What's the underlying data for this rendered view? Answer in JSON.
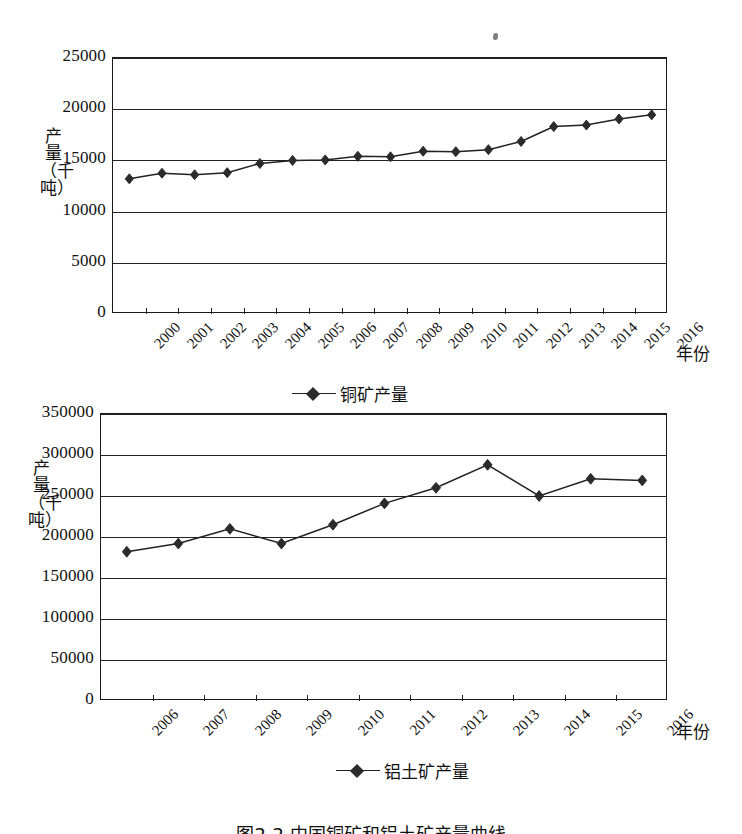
{
  "figure": {
    "caption": "图2-2    中国铜矿和铝土矿产量曲线"
  },
  "chart_data": [
    {
      "type": "line",
      "id": "copper-ore-production",
      "title": "",
      "xlabel": "年份",
      "ylabel": "产量（千吨）",
      "legend": [
        "铜矿产量"
      ],
      "legend_position": "bottom",
      "grid": true,
      "ylim": [
        0,
        25000
      ],
      "yticks": [
        0,
        5000,
        10000,
        15000,
        20000,
        25000
      ],
      "ytick_labels": [
        "0",
        "5000",
        "10000",
        "15000",
        "20000",
        "25000"
      ],
      "categories": [
        "2000",
        "2001",
        "2002",
        "2003",
        "2004",
        "2005",
        "2006",
        "2007",
        "2008",
        "2009",
        "2010",
        "2011",
        "2012",
        "2013",
        "2014",
        "2015",
        "2016"
      ],
      "series": [
        {
          "name": "铜矿产量",
          "values": [
            13200,
            13750,
            13600,
            13800,
            14700,
            15000,
            15050,
            15400,
            15350,
            15900,
            15850,
            16050,
            16850,
            18300,
            18450,
            19050,
            19450
          ]
        }
      ]
    },
    {
      "type": "line",
      "id": "bauxite-production",
      "title": "",
      "xlabel": "年份",
      "ylabel": "产量（千吨）",
      "legend": [
        "铝土矿产量"
      ],
      "legend_position": "bottom",
      "grid": true,
      "ylim": [
        0,
        350000
      ],
      "yticks": [
        0,
        50000,
        100000,
        150000,
        200000,
        250000,
        300000,
        350000
      ],
      "ytick_labels": [
        "0",
        "50000",
        "100000",
        "150000",
        "200000",
        "250000",
        "300000",
        "350000"
      ],
      "categories": [
        "2006",
        "2007",
        "2008",
        "2009",
        "2010",
        "2011",
        "2012",
        "2013",
        "2014",
        "2015",
        "2016"
      ],
      "series": [
        {
          "name": "铝土矿产量",
          "values": [
            182000,
            192000,
            210000,
            192000,
            215000,
            241000,
            260000,
            288000,
            250000,
            271000,
            269000
          ]
        }
      ]
    }
  ],
  "colors": {
    "line": "#222222",
    "marker": "#2b2b2b",
    "axis": "#1a1a1a",
    "text": "#111111",
    "background": "#ffffff"
  }
}
